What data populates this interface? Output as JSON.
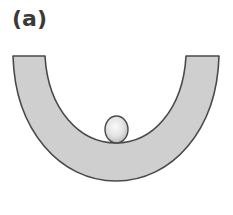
{
  "figure": {
    "label": "(a)",
    "colors": {
      "track_fill": "#cfcfcf",
      "track_stroke": "#4a4a4a",
      "ball_highlight": "#f7f7f7",
      "ball_shadow": "#bdbdbd",
      "ball_stroke": "#4a4a4a",
      "label": "#3a3a3a"
    }
  }
}
